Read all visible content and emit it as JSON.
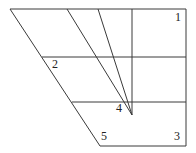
{
  "diagram": {
    "type": "geometric-figure",
    "width": 196,
    "height": 153,
    "colors": {
      "background": "#ffffff",
      "stroke": "#3a3a3a",
      "label": "#222222"
    },
    "vertices": {
      "top_left": [
        10,
        9
      ],
      "top_right": [
        186,
        9
      ],
      "bottom_right": [
        186,
        146
      ],
      "bottom_left": [
        100,
        146
      ],
      "apex": [
        132,
        115
      ]
    },
    "labels": [
      {
        "id": "1",
        "text": "1",
        "x": 175,
        "y": 21
      },
      {
        "id": "2",
        "text": "2",
        "x": 52,
        "y": 68
      },
      {
        "id": "3",
        "text": "3",
        "x": 174,
        "y": 140
      },
      {
        "id": "4",
        "text": "4",
        "x": 116,
        "y": 112
      },
      {
        "id": "5",
        "text": "5",
        "x": 101,
        "y": 140
      }
    ]
  }
}
